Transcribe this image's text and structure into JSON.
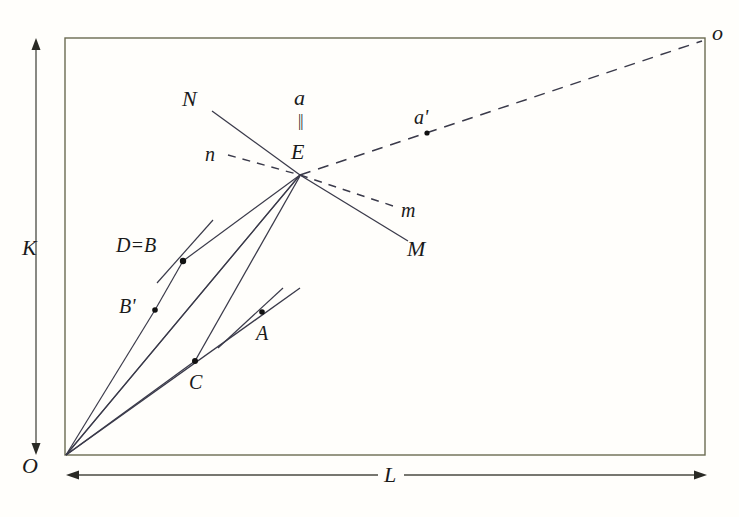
{
  "figure": {
    "type": "geometric-diagram",
    "background_color": "#fffefb",
    "line_color": "#3a3a4a",
    "frame_color": "#6b6b52",
    "text_color": "#1a1a1a",
    "axes": {
      "vertical_label": "K",
      "horizontal_label": "L",
      "origin_label": "O",
      "far_corner_label": "o"
    },
    "labels": {
      "N": "N",
      "M": "M",
      "n": "n",
      "m": "m",
      "a": "a",
      "a_prime": "a'",
      "parallel_mark": "||",
      "E": "E",
      "D_equals_B": "D=B",
      "B_prime": "B'",
      "A": "A",
      "C": "C"
    },
    "points": [
      {
        "name": "E",
        "label": "E",
        "x": 300,
        "y": 175
      },
      {
        "name": "a'",
        "label": "a'",
        "x": 427,
        "y": 133
      },
      {
        "name": "D=B",
        "label": "D=B",
        "x": 183,
        "y": 261
      },
      {
        "name": "B'",
        "label": "B'",
        "x": 155,
        "y": 310
      },
      {
        "name": "A",
        "label": "A",
        "x": 262,
        "y": 312
      },
      {
        "name": "C",
        "label": "C",
        "x": 195,
        "y": 361
      },
      {
        "name": "O",
        "label": "O",
        "x": 66,
        "y": 455
      }
    ],
    "frame": {
      "left": 65,
      "top": 38,
      "right": 705,
      "bottom": 455
    }
  }
}
